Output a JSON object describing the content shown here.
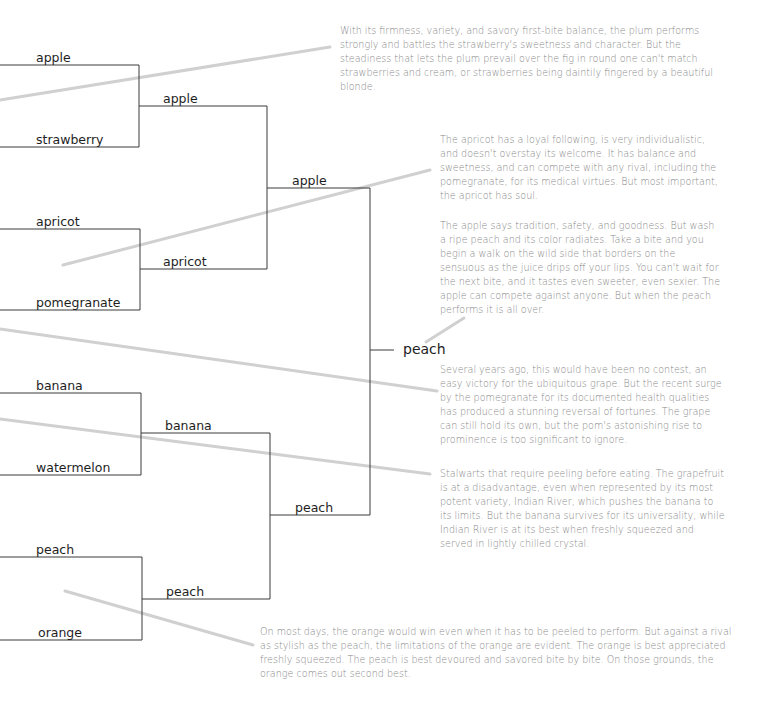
{
  "bracket": {
    "round1": [
      "apple",
      "strawberry",
      "apricot",
      "pomegranate",
      "banana",
      "watermelon",
      "peach",
      "orange"
    ],
    "round2": [
      "apple",
      "apricot",
      "banana",
      "peach"
    ],
    "round3": [
      "apple",
      "peach"
    ],
    "winner": "peach"
  },
  "commentary": [
    {
      "id": "plum-strawberry",
      "text": "With its firmness, variety, and savory first-bite balance, the plum performs strongly and battles the strawberry's sweetness and character. But the steadiness that lets the plum prevail over the fig in round one can't match strawberries and cream, or strawberries being daintily fingered by a beautiful blonde."
    },
    {
      "id": "apricot-pomegranate",
      "text": "The apricot has a loyal following, is very individualistic, and doesn't overstay its welcome. It has balance and sweetness, and can compete with any rival, including the pomegranate, for its medical virtues. But most important, the apricot has soul."
    },
    {
      "id": "apple-peach",
      "text": "The apple says tradition, safety, and goodness. But wash a ripe peach and its color radiates. Take a bite and you begin a walk on the wild side that borders on the sensuous as the juice drips off your lips. You can't wait for the next bite, and it tastes even sweeter, even sexier. The apple can compete against anyone. But when the peach performs it is all over."
    },
    {
      "id": "grape-pomegranate",
      "text": "Several years ago, this would have been no contest, an easy victory for the ubiquitous grape. But the recent surge by the pomegranate for its documented health qualities has produced a stunning reversal of fortunes. The grape can still hold its own, but the pom's astonishing rise to prominence is too significant to ignore."
    },
    {
      "id": "banana-grapefruit",
      "text": "Stalwarts that require peeling before eating. The grapefruit is at a disadvantage, even when represented by its most potent variety, Indian River, which pushes the banana to its limits. But the banana survives for its universality, while Indian River is at its best when freshly squeezed and served in lightly chilled crystal."
    },
    {
      "id": "peach-orange",
      "text": "On most days, the orange would win even when it has to be peeled to perform. But against a rival as stylish as the peach, the limitations of the orange are evident. The orange is best appreciated freshly squeezed. The peach is best devoured and savored bite by bite. On those grounds, the orange comes out second best."
    }
  ],
  "colors": {
    "bracket_line": "#3a3a3a",
    "leader_line": "#cfcfcf",
    "label_text": "#1e1e1e",
    "note_text": "#8a8a8a"
  }
}
